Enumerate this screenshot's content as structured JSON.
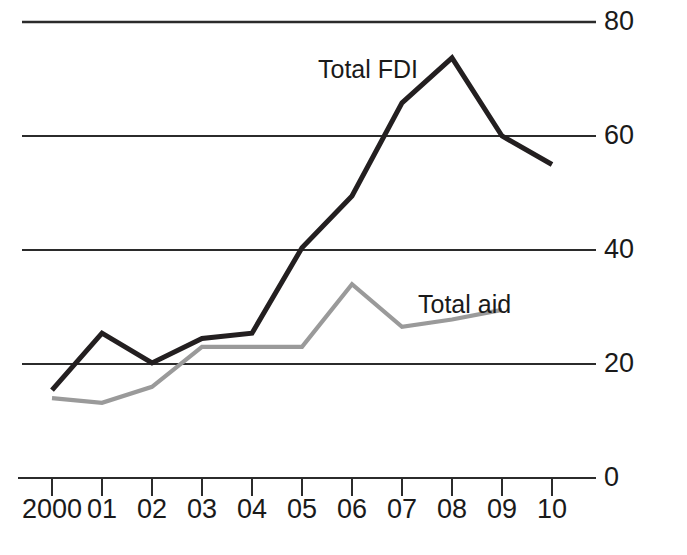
{
  "chart_data": {
    "type": "line",
    "title": "",
    "subtitle": "",
    "xlabel": "",
    "ylabel": "",
    "categories": [
      "2000",
      "01",
      "02",
      "03",
      "04",
      "05",
      "06",
      "07",
      "08",
      "09",
      "10"
    ],
    "x_tick_labels": [
      "2000",
      "01",
      "02",
      "03",
      "04",
      "05",
      "06",
      "07",
      "08",
      "09",
      "10"
    ],
    "y_tick_labels": [
      "0",
      "20",
      "40",
      "60",
      "80"
    ],
    "y_ticks": [
      0,
      20,
      40,
      60,
      80
    ],
    "ylim": [
      0,
      80
    ],
    "grid": "horizontal",
    "legend_position": "inline-annotation",
    "series": [
      {
        "name": "Total FDI",
        "color": "#231f20",
        "label_text": "Total FDI",
        "values": [
          15.4,
          25.4,
          20.2,
          24.5,
          25.4,
          40.4,
          49.5,
          65.8,
          73.7,
          60.0,
          55.0
        ]
      },
      {
        "name": "Total aid",
        "color": "#9a9a9a",
        "label_text": "Total aid",
        "values": [
          14.0,
          13.2,
          16.0,
          23.0,
          23.0,
          23.0,
          34.0,
          26.5,
          27.8,
          29.5,
          null
        ]
      }
    ],
    "annotations": [
      {
        "text": "Total FDI",
        "series": "Total FDI"
      },
      {
        "text": "Total aid",
        "series": "Total aid"
      }
    ]
  },
  "labels": {
    "y0": "0",
    "y20": "20",
    "y40": "40",
    "y60": "60",
    "y80": "80",
    "x0": "2000",
    "x1": "01",
    "x2": "02",
    "x3": "03",
    "x4": "04",
    "x5": "05",
    "x6": "06",
    "x7": "07",
    "x8": "08",
    "x9": "09",
    "x10": "10",
    "series_fdi": "Total FDI",
    "series_aid": "Total aid"
  }
}
